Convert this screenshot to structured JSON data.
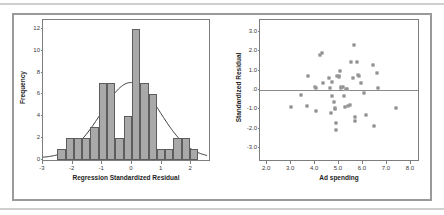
{
  "figure": {
    "background_color": "#ffffff",
    "frame_color": "#9a9a9a",
    "rule_color": "#cfcfcf"
  },
  "chart_data": [
    {
      "type": "bar",
      "panel": "left",
      "title": "",
      "xlabel": "Regression Standardized Residual",
      "ylabel": "Frequency",
      "xlim": [
        -3.0,
        2.6
      ],
      "ylim": [
        0,
        12.8
      ],
      "grid": false,
      "legend": "none",
      "xticks": [
        "-3",
        "-2",
        "-1",
        "0",
        "1",
        "2"
      ],
      "xtick_values": [
        -3,
        -2,
        -1,
        0,
        1,
        2
      ],
      "yticks": [
        "0",
        "2",
        "4",
        "6",
        "8",
        "10",
        "12"
      ],
      "ytick_values": [
        0,
        2,
        4,
        6,
        8,
        10,
        12
      ],
      "bin_width": 0.28,
      "bin_left_edges": [
        -2.52,
        -2.24,
        -1.96,
        -1.68,
        -1.4,
        -1.12,
        -0.84,
        -0.56,
        -0.28,
        0.0,
        0.28,
        0.56,
        0.84,
        1.12,
        1.4,
        1.68,
        1.96
      ],
      "bin_centers": [
        -2.38,
        -2.1,
        -1.82,
        -1.54,
        -1.26,
        -0.98,
        -0.7,
        -0.42,
        -0.14,
        0.14,
        0.42,
        0.7,
        0.98,
        1.26,
        1.54,
        1.82,
        2.1
      ],
      "values": [
        1,
        2,
        2,
        2,
        3,
        7,
        7,
        2,
        4,
        12,
        7,
        6,
        1,
        1,
        2,
        2,
        1
      ],
      "overlay": {
        "name": "normal-distribution-curve",
        "mean": 0.0,
        "sd": 1.0,
        "peak_frequency": 7.0,
        "color": "#333333"
      },
      "bar_fill": "#a9a9a9",
      "bar_edge": "#5d5d5d"
    },
    {
      "type": "scatter",
      "panel": "right",
      "title": "",
      "xlabel": "Ad spending",
      "ylabel": "Standardized Residual",
      "xlim": [
        1.7,
        8.3
      ],
      "ylim": [
        -3.6,
        3.6
      ],
      "grid": false,
      "legend": "none",
      "xticks": [
        "2.0",
        "3.0",
        "4.0",
        "5.0",
        "6.0",
        "7.0",
        "8.0"
      ],
      "xtick_values": [
        2.0,
        3.0,
        4.0,
        5.0,
        6.0,
        7.0,
        8.0
      ],
      "yticks": [
        "3.0",
        "2.0",
        "1.0",
        ".0",
        "-1.0",
        "-2.0",
        "-3.0"
      ],
      "ytick_values": [
        3.0,
        2.0,
        1.0,
        0.0,
        -1.0,
        -2.0,
        -3.0
      ],
      "reference_line": {
        "name": "zero-reference-line",
        "y": 0.0,
        "color": "#8a8a8a"
      },
      "marker": {
        "shape": "open-square",
        "edge": "#6f6f6f",
        "fill": "#ffffff",
        "size_px": 3
      },
      "points": [
        [
          3.0,
          -0.88
        ],
        [
          3.4,
          -0.27
        ],
        [
          3.65,
          -0.83
        ],
        [
          3.72,
          0.73
        ],
        [
          4.0,
          0.17
        ],
        [
          4.02,
          0.1
        ],
        [
          4.05,
          -1.07
        ],
        [
          4.2,
          1.8
        ],
        [
          4.28,
          1.88
        ],
        [
          4.32,
          0.37
        ],
        [
          4.6,
          0.62
        ],
        [
          4.62,
          0.08
        ],
        [
          4.68,
          -1.2
        ],
        [
          4.7,
          0.42
        ],
        [
          4.72,
          -0.32
        ],
        [
          4.8,
          -0.62
        ],
        [
          4.82,
          -0.9
        ],
        [
          4.85,
          -1.0
        ],
        [
          4.86,
          -1.72
        ],
        [
          4.88,
          -2.05
        ],
        [
          4.92,
          0.72
        ],
        [
          4.98,
          0.68
        ],
        [
          5.02,
          0.7
        ],
        [
          5.05,
          0.96
        ],
        [
          5.08,
          0.18
        ],
        [
          5.1,
          0.12
        ],
        [
          5.18,
          0.14
        ],
        [
          5.2,
          -0.3
        ],
        [
          5.25,
          -0.85
        ],
        [
          5.3,
          0.06
        ],
        [
          5.32,
          0.05
        ],
        [
          5.38,
          -0.8
        ],
        [
          5.45,
          -0.78
        ],
        [
          5.5,
          1.45
        ],
        [
          5.58,
          0.62
        ],
        [
          5.62,
          2.3
        ],
        [
          5.66,
          -1.38
        ],
        [
          5.68,
          -1.6
        ],
        [
          5.75,
          1.45
        ],
        [
          5.8,
          0.78
        ],
        [
          5.82,
          0.72
        ],
        [
          5.9,
          0.35
        ],
        [
          6.05,
          -0.15
        ],
        [
          6.12,
          -1.28
        ],
        [
          6.4,
          1.28
        ],
        [
          6.48,
          -1.85
        ],
        [
          6.58,
          0.9
        ],
        [
          6.62,
          0.1
        ],
        [
          7.38,
          -0.93
        ]
      ],
      "n_points": 49
    }
  ]
}
